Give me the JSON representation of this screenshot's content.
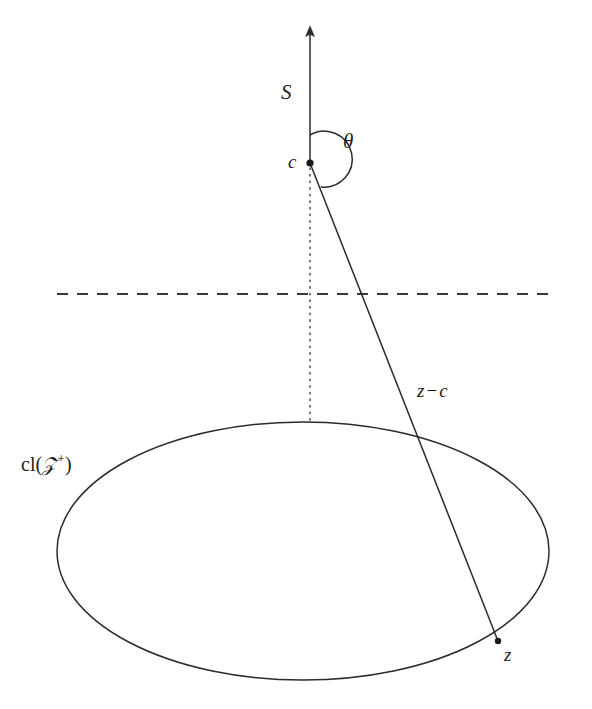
{
  "figure": {
    "kind": "geometric-diagram",
    "background_color": "#ffffff",
    "stroke_color": "#2b2b2b",
    "labels": {
      "ray_S": "S",
      "angle_theta": "θ",
      "apex_point": "c",
      "vector_z_minus_c": "z",
      "vector_operator": "−",
      "vector_second_term": "c",
      "set_closure_prefix": "cl(",
      "set_symbol": "𝒵",
      "set_superscript": "+",
      "set_closure_suffix": ")",
      "boundary_point": "z"
    },
    "geometry": {
      "apex": {
        "x": 310,
        "y": 163
      },
      "ray_top": {
        "x": 310,
        "y": 28
      },
      "boundary_point": {
        "x": 498,
        "y": 641
      },
      "ellipse_center": {
        "x": 303,
        "y": 551
      },
      "ellipse_rx": 246,
      "ellipse_ry": 129,
      "dashed_line_y": 294,
      "dashed_line_x_start": 57,
      "dashed_line_x_end": 556,
      "dotted_axis_from_y": 168,
      "dotted_axis_to_y": 422,
      "angle_arc_radius": 28
    }
  }
}
